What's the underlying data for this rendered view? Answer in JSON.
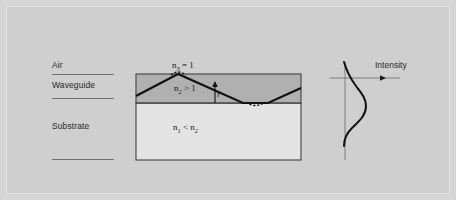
{
  "figure": {
    "background_color": "#d5d5d5",
    "panel_color": "#cfcfcf"
  },
  "layer_labels": [
    {
      "name": "air-label",
      "text": "Air"
    },
    {
      "name": "waveguide-label",
      "text": "Waveguide"
    },
    {
      "name": "substrate-label",
      "text": "Substrate"
    }
  ],
  "diagram": {
    "layers": [
      {
        "id": "waveguide-layer",
        "label": "Waveguide",
        "fill": "#b0b0b0",
        "index_label_html": "n<sub>2</sub> &gt; 1",
        "index_label_text": "n2 > 1"
      },
      {
        "id": "substrate-layer",
        "label": "Substrate",
        "fill": "#e4e4e4",
        "index_label_html": "n<sub>1</sub> &lt; n<sub>2</sub>",
        "index_label_text": "n1 < n2"
      }
    ],
    "air_index_label_html": "n<sub>3</sub> = 1",
    "air_index_label_text": "n3 = 1",
    "angle_label": "γ",
    "ray_color": "#111111",
    "border_color": "#4a4d50"
  },
  "intensity_plot": {
    "axis_label": "Intensity",
    "axis_color": "#7a7d80",
    "curve_color": "#111111",
    "curve_type": "guided-mode-profile"
  },
  "chart_data": {
    "type": "line",
    "xlabel": "Intensity",
    "ylabel": "",
    "orientation": "horizontal-intensity-vertical-depth",
    "x": [
      0.02,
      0.04,
      0.07,
      0.12,
      0.2,
      0.33,
      0.52,
      0.74,
      0.92,
      1.0,
      0.95,
      0.8,
      0.6,
      0.42,
      0.28,
      0.18,
      0.11,
      0.07,
      0.04,
      0.02
    ],
    "y": [
      -1.0,
      -0.9,
      -0.8,
      -0.7,
      -0.6,
      -0.5,
      -0.4,
      -0.3,
      -0.2,
      -0.1,
      0.0,
      0.1,
      0.2,
      0.3,
      0.4,
      0.5,
      0.6,
      0.7,
      0.85,
      1.0
    ],
    "legend": [],
    "grid": false
  }
}
